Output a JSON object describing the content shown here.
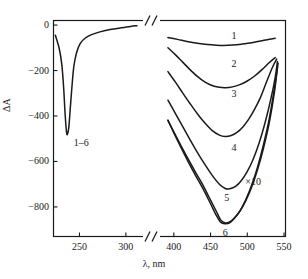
{
  "chart_data": {
    "type": "line",
    "title": "",
    "xlabel": "λ, nm",
    "ylabel": "ΔA",
    "grid": false,
    "legend_position": "inline-curve-labels",
    "axis_break": true,
    "x_axis": {
      "left_segment": {
        "min": 222,
        "max": 312,
        "ticks": [
          250,
          300
        ],
        "tick_labels": [
          "250",
          "300"
        ]
      },
      "right_segment": {
        "min": 388,
        "max": 552,
        "ticks": [
          400,
          450,
          500,
          550
        ],
        "tick_labels": [
          "400",
          "450",
          "500",
          "550"
        ]
      }
    },
    "y_axis": {
      "min": -930,
      "max": 20,
      "ticks": [
        0,
        -200,
        -400,
        -600,
        -800
      ],
      "tick_labels": [
        "0",
        "−200",
        "−400",
        "−600",
        "−800"
      ]
    },
    "annotations": [
      {
        "text": "1–6",
        "x": 252,
        "y": -520,
        "segment": "left"
      },
      {
        "text": "×10",
        "x": 508,
        "y": -690,
        "segment": "right"
      }
    ],
    "uv_band": {
      "label": "1–6",
      "comment": "All six curves overlap in the UV region",
      "points": [
        [
          224,
          -45
        ],
        [
          228,
          -100
        ],
        [
          231,
          -175
        ],
        [
          233,
          -280
        ],
        [
          234.5,
          -390
        ],
        [
          236,
          -470
        ],
        [
          237,
          -480
        ],
        [
          238.5,
          -450
        ],
        [
          240,
          -370
        ],
        [
          242,
          -265
        ],
        [
          244,
          -180
        ],
        [
          247,
          -120
        ],
        [
          251,
          -80
        ],
        [
          256,
          -58
        ],
        [
          263,
          -42
        ],
        [
          272,
          -30
        ],
        [
          283,
          -20
        ],
        [
          295,
          -12
        ],
        [
          305,
          -6
        ],
        [
          312,
          -3
        ]
      ]
    },
    "series": [
      {
        "name": "1",
        "label": "1",
        "label_x": 482,
        "label_y": -48,
        "minimum": {
          "x": 468,
          "y": -90
        },
        "points": [
          [
            392,
            -55
          ],
          [
            405,
            -63
          ],
          [
            418,
            -72
          ],
          [
            432,
            -80
          ],
          [
            446,
            -86
          ],
          [
            458,
            -89
          ],
          [
            468,
            -90
          ],
          [
            480,
            -88
          ],
          [
            492,
            -84
          ],
          [
            506,
            -78
          ],
          [
            518,
            -70
          ],
          [
            530,
            -62
          ],
          [
            538,
            -58
          ]
        ]
      },
      {
        "name": "2",
        "label": "2",
        "label_x": 482,
        "label_y": -170,
        "minimum": {
          "x": 468,
          "y": -275
        },
        "points": [
          [
            392,
            -100
          ],
          [
            402,
            -130
          ],
          [
            412,
            -163
          ],
          [
            422,
            -196
          ],
          [
            432,
            -226
          ],
          [
            442,
            -250
          ],
          [
            452,
            -266
          ],
          [
            462,
            -274
          ],
          [
            470,
            -276
          ],
          [
            480,
            -272
          ],
          [
            490,
            -262
          ],
          [
            500,
            -246
          ],
          [
            510,
            -224
          ],
          [
            520,
            -196
          ],
          [
            530,
            -165
          ],
          [
            538,
            -143
          ]
        ]
      },
      {
        "name": "3",
        "label": "3",
        "label_x": 482,
        "label_y": -305,
        "minimum": {
          "x": 468,
          "y": -490
        },
        "points": [
          [
            392,
            -205
          ],
          [
            402,
            -250
          ],
          [
            412,
            -298
          ],
          [
            422,
            -345
          ],
          [
            432,
            -390
          ],
          [
            442,
            -430
          ],
          [
            452,
            -463
          ],
          [
            462,
            -484
          ],
          [
            470,
            -490
          ],
          [
            478,
            -486
          ],
          [
            486,
            -472
          ],
          [
            494,
            -448
          ],
          [
            502,
            -414
          ],
          [
            510,
            -370
          ],
          [
            518,
            -318
          ],
          [
            526,
            -252
          ],
          [
            534,
            -188
          ],
          [
            540,
            -150
          ]
        ]
      },
      {
        "name": "4",
        "label": "4",
        "label_x": 482,
        "label_y": -540,
        "minimum": {
          "x": 468,
          "y": -720
        },
        "points": [
          [
            392,
            -330
          ],
          [
            402,
            -388
          ],
          [
            412,
            -446
          ],
          [
            422,
            -504
          ],
          [
            432,
            -560
          ],
          [
            442,
            -612
          ],
          [
            452,
            -660
          ],
          [
            462,
            -700
          ],
          [
            470,
            -719
          ],
          [
            476,
            -720
          ],
          [
            484,
            -710
          ],
          [
            492,
            -684
          ],
          [
            500,
            -644
          ],
          [
            508,
            -590
          ],
          [
            516,
            -520
          ],
          [
            524,
            -432
          ],
          [
            532,
            -326
          ],
          [
            538,
            -230
          ],
          [
            541,
            -160
          ]
        ]
      },
      {
        "name": "5",
        "label": "5",
        "label_x": 472,
        "label_y": -760,
        "minimum": {
          "x": 466,
          "y": -870
        },
        "points": [
          [
            392,
            -418
          ],
          [
            400,
            -470
          ],
          [
            410,
            -532
          ],
          [
            420,
            -592
          ],
          [
            430,
            -650
          ],
          [
            440,
            -706
          ],
          [
            450,
            -770
          ],
          [
            458,
            -820
          ],
          [
            464,
            -858
          ],
          [
            470,
            -870
          ],
          [
            476,
            -866
          ],
          [
            482,
            -850
          ],
          [
            490,
            -818
          ],
          [
            498,
            -772
          ],
          [
            506,
            -712
          ],
          [
            514,
            -636
          ],
          [
            522,
            -542
          ],
          [
            530,
            -428
          ],
          [
            537,
            -294
          ],
          [
            541,
            -186
          ]
        ]
      },
      {
        "name": "6",
        "label": "6",
        "label_x": 470,
        "label_y": -915,
        "minimum": {
          "x": 466,
          "y": -872
        },
        "points": [
          [
            392,
            -420
          ],
          [
            400,
            -474
          ],
          [
            410,
            -540
          ],
          [
            420,
            -604
          ],
          [
            430,
            -664
          ],
          [
            440,
            -722
          ],
          [
            450,
            -786
          ],
          [
            458,
            -838
          ],
          [
            464,
            -868
          ],
          [
            470,
            -874
          ],
          [
            476,
            -870
          ],
          [
            482,
            -852
          ],
          [
            490,
            -818
          ],
          [
            498,
            -768
          ],
          [
            506,
            -704
          ],
          [
            514,
            -624
          ],
          [
            522,
            -526
          ],
          [
            530,
            -410
          ],
          [
            537,
            -276
          ],
          [
            542,
            -168
          ]
        ]
      }
    ]
  }
}
